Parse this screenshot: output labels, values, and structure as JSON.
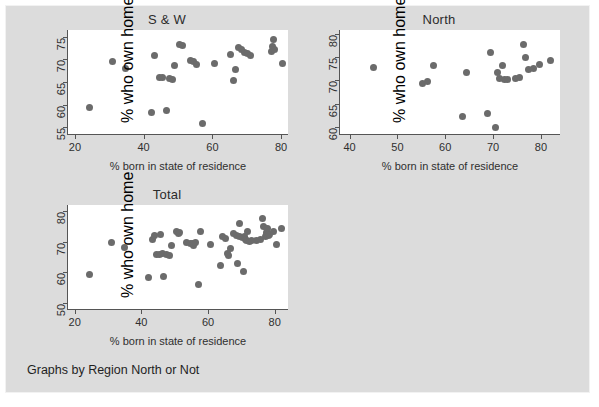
{
  "figure": {
    "background_color": "#dcdcdc",
    "plot_background_color": "#ffffff",
    "marker_color": "#6b6b6b",
    "axis_color": "#555555",
    "note": "Graphs by Region North or Not"
  },
  "chart_data": [
    {
      "type": "scatter",
      "title": "S & W",
      "xlabel": "% born in state of residence",
      "ylabel": "% who own home",
      "xlim": [
        18,
        82
      ],
      "ylim": [
        53.5,
        76.5
      ],
      "xticks": [
        20,
        40,
        60,
        80
      ],
      "yticks": [
        55,
        60,
        65,
        70,
        75
      ],
      "grid": false,
      "legend": "none",
      "points": [
        {
          "x": 24.3,
          "y": 59.3
        },
        {
          "x": 31.0,
          "y": 69.6
        },
        {
          "x": 34.8,
          "y": 68.0
        },
        {
          "x": 42.2,
          "y": 58.2
        },
        {
          "x": 43.2,
          "y": 70.8
        },
        {
          "x": 44.6,
          "y": 65.9
        },
        {
          "x": 45.4,
          "y": 65.9
        },
        {
          "x": 46.6,
          "y": 58.7
        },
        {
          "x": 47.4,
          "y": 65.7
        },
        {
          "x": 48.3,
          "y": 65.6
        },
        {
          "x": 48.9,
          "y": 68.7
        },
        {
          "x": 50.5,
          "y": 73.4
        },
        {
          "x": 51.3,
          "y": 73.0
        },
        {
          "x": 53.5,
          "y": 69.7
        },
        {
          "x": 54.6,
          "y": 69.6
        },
        {
          "x": 55.5,
          "y": 68.8
        },
        {
          "x": 57.2,
          "y": 55.8
        },
        {
          "x": 60.6,
          "y": 69.0
        },
        {
          "x": 65.2,
          "y": 71.2
        },
        {
          "x": 66.2,
          "y": 65.4
        },
        {
          "x": 66.6,
          "y": 67.8
        },
        {
          "x": 67.7,
          "y": 72.6
        },
        {
          "x": 68.5,
          "y": 72.1
        },
        {
          "x": 69.3,
          "y": 71.6
        },
        {
          "x": 70.3,
          "y": 71.4
        },
        {
          "x": 71.2,
          "y": 70.9
        },
        {
          "x": 77.3,
          "y": 71.8
        },
        {
          "x": 77.6,
          "y": 72.9
        },
        {
          "x": 77.9,
          "y": 74.4
        },
        {
          "x": 78.2,
          "y": 72.2
        },
        {
          "x": 80.4,
          "y": 69.0
        }
      ]
    },
    {
      "type": "scatter",
      "title": "North",
      "xlabel": "% born in state of residence",
      "ylabel": "% who own home",
      "xlim": [
        38,
        84
      ],
      "ylim": [
        58.5,
        80.8
      ],
      "xticks": [
        40,
        50,
        60,
        70,
        80
      ],
      "yticks": [
        60,
        65,
        70,
        75,
        80
      ],
      "grid": false,
      "legend": "none",
      "points": [
        {
          "x": 45.0,
          "y": 72.7
        },
        {
          "x": 55.3,
          "y": 69.3
        },
        {
          "x": 56.2,
          "y": 69.7
        },
        {
          "x": 57.6,
          "y": 73.3
        },
        {
          "x": 63.6,
          "y": 62.2
        },
        {
          "x": 64.4,
          "y": 71.7
        },
        {
          "x": 68.9,
          "y": 62.9
        },
        {
          "x": 69.5,
          "y": 76.0
        },
        {
          "x": 70.6,
          "y": 60.0
        },
        {
          "x": 70.9,
          "y": 71.8
        },
        {
          "x": 71.4,
          "y": 70.5
        },
        {
          "x": 71.9,
          "y": 73.2
        },
        {
          "x": 72.3,
          "y": 70.2
        },
        {
          "x": 73.0,
          "y": 70.3
        },
        {
          "x": 74.6,
          "y": 70.4
        },
        {
          "x": 75.6,
          "y": 70.6
        },
        {
          "x": 76.4,
          "y": 77.6
        },
        {
          "x": 76.7,
          "y": 74.9
        },
        {
          "x": 77.5,
          "y": 72.4
        },
        {
          "x": 78.4,
          "y": 72.5
        },
        {
          "x": 79.6,
          "y": 73.4
        },
        {
          "x": 81.9,
          "y": 74.3
        }
      ]
    },
    {
      "type": "scatter",
      "title": "Total",
      "xlabel": "% born in state of residence",
      "ylabel": "% who own home",
      "xlim": [
        18,
        84
      ],
      "ylim": [
        48,
        82
      ],
      "xticks": [
        20,
        40,
        60,
        80
      ],
      "yticks": [
        50,
        60,
        70,
        80
      ],
      "grid": false,
      "legend": "none",
      "points": [
        {
          "x": 24.3,
          "y": 59.4
        },
        {
          "x": 31.0,
          "y": 69.6
        },
        {
          "x": 34.8,
          "y": 68.0
        },
        {
          "x": 42.2,
          "y": 58.2
        },
        {
          "x": 43.2,
          "y": 70.8
        },
        {
          "x": 44.0,
          "y": 72.0
        },
        {
          "x": 44.6,
          "y": 65.9
        },
        {
          "x": 45.4,
          "y": 65.8
        },
        {
          "x": 45.8,
          "y": 72.4
        },
        {
          "x": 46.3,
          "y": 66.2
        },
        {
          "x": 46.6,
          "y": 58.7
        },
        {
          "x": 47.4,
          "y": 65.7
        },
        {
          "x": 48.3,
          "y": 65.6
        },
        {
          "x": 48.9,
          "y": 68.7
        },
        {
          "x": 50.5,
          "y": 73.4
        },
        {
          "x": 51.0,
          "y": 72.6
        },
        {
          "x": 51.3,
          "y": 73.0
        },
        {
          "x": 53.5,
          "y": 69.7
        },
        {
          "x": 54.6,
          "y": 69.3
        },
        {
          "x": 55.3,
          "y": 69.3
        },
        {
          "x": 55.5,
          "y": 68.8
        },
        {
          "x": 56.2,
          "y": 69.8
        },
        {
          "x": 57.2,
          "y": 55.9
        },
        {
          "x": 57.6,
          "y": 73.3
        },
        {
          "x": 60.6,
          "y": 69.0
        },
        {
          "x": 63.6,
          "y": 62.2
        },
        {
          "x": 64.4,
          "y": 71.7
        },
        {
          "x": 65.2,
          "y": 71.2
        },
        {
          "x": 65.8,
          "y": 66.3
        },
        {
          "x": 66.2,
          "y": 65.4
        },
        {
          "x": 66.6,
          "y": 67.8
        },
        {
          "x": 67.7,
          "y": 72.6
        },
        {
          "x": 68.5,
          "y": 72.1
        },
        {
          "x": 68.9,
          "y": 62.9
        },
        {
          "x": 69.3,
          "y": 71.6
        },
        {
          "x": 69.5,
          "y": 76.0
        },
        {
          "x": 70.3,
          "y": 71.4
        },
        {
          "x": 70.6,
          "y": 60.3
        },
        {
          "x": 70.9,
          "y": 71.8
        },
        {
          "x": 71.2,
          "y": 70.9
        },
        {
          "x": 71.4,
          "y": 70.5
        },
        {
          "x": 71.9,
          "y": 73.2
        },
        {
          "x": 72.3,
          "y": 70.2
        },
        {
          "x": 73.0,
          "y": 70.3
        },
        {
          "x": 74.6,
          "y": 70.4
        },
        {
          "x": 75.6,
          "y": 70.6
        },
        {
          "x": 76.4,
          "y": 77.6
        },
        {
          "x": 76.7,
          "y": 74.9
        },
        {
          "x": 77.3,
          "y": 71.8
        },
        {
          "x": 77.5,
          "y": 72.4
        },
        {
          "x": 77.6,
          "y": 72.9
        },
        {
          "x": 77.9,
          "y": 74.4
        },
        {
          "x": 78.2,
          "y": 72.2
        },
        {
          "x": 78.4,
          "y": 72.5
        },
        {
          "x": 79.6,
          "y": 73.4
        },
        {
          "x": 80.4,
          "y": 69.0
        },
        {
          "x": 81.9,
          "y": 74.3
        }
      ]
    }
  ],
  "panels": [
    {
      "key": "sw",
      "left": 30,
      "top": 10,
      "width": 280,
      "height": 160,
      "plot": {
        "left": 62,
        "top": 32,
        "width": 222,
        "height": 102
      }
    },
    {
      "key": "north",
      "left": 300,
      "top": 10,
      "width": 280,
      "height": 160,
      "plot": {
        "left": 334,
        "top": 32,
        "width": 222,
        "height": 102
      }
    },
    {
      "key": "total",
      "left": 30,
      "top": 185,
      "width": 280,
      "height": 170,
      "plot": {
        "left": 62,
        "top": 207,
        "width": 222,
        "height": 102
      }
    }
  ]
}
